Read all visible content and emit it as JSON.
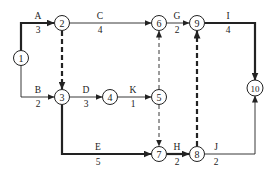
{
  "diagram": {
    "type": "activity-on-arrow network (double-code network diagram)",
    "colors": {
      "line": "#222222",
      "background": "#ffffff"
    },
    "nodes": [
      {
        "id": "1",
        "x": 21,
        "y": 58
      },
      {
        "id": "2",
        "x": 62,
        "y": 23
      },
      {
        "id": "3",
        "x": 62,
        "y": 97
      },
      {
        "id": "4",
        "x": 110,
        "y": 97
      },
      {
        "id": "5",
        "x": 159,
        "y": 97
      },
      {
        "id": "6",
        "x": 159,
        "y": 23
      },
      {
        "id": "7",
        "x": 159,
        "y": 154
      },
      {
        "id": "8",
        "x": 197,
        "y": 154
      },
      {
        "id": "9",
        "x": 197,
        "y": 23
      },
      {
        "id": "10",
        "x": 255,
        "y": 88
      }
    ],
    "activities": [
      {
        "name": "A",
        "duration": "3",
        "from": "1",
        "to": "2",
        "critical": true,
        "dummy": false
      },
      {
        "name": "B",
        "duration": "2",
        "from": "1",
        "to": "3",
        "critical": false,
        "dummy": false
      },
      {
        "name": "C",
        "duration": "4",
        "from": "2",
        "to": "6",
        "critical": false,
        "dummy": false
      },
      {
        "name": "D",
        "duration": "3",
        "from": "3",
        "to": "4",
        "critical": false,
        "dummy": false
      },
      {
        "name": "K",
        "duration": "1",
        "from": "4",
        "to": "5",
        "critical": false,
        "dummy": false
      },
      {
        "name": "E",
        "duration": "5",
        "from": "3",
        "to": "7",
        "critical": true,
        "dummy": false
      },
      {
        "name": "G",
        "duration": "2",
        "from": "6",
        "to": "9",
        "critical": false,
        "dummy": false
      },
      {
        "name": "H",
        "duration": "2",
        "from": "7",
        "to": "8",
        "critical": true,
        "dummy": false
      },
      {
        "name": "I",
        "duration": "4",
        "from": "9",
        "to": "10",
        "critical": true,
        "dummy": false
      },
      {
        "name": "J",
        "duration": "2",
        "from": "8",
        "to": "10",
        "critical": false,
        "dummy": false
      },
      {
        "name": "",
        "duration": "",
        "from": "2",
        "to": "3",
        "critical": true,
        "dummy": true
      },
      {
        "name": "",
        "duration": "",
        "from": "5",
        "to": "6",
        "critical": false,
        "dummy": true
      },
      {
        "name": "",
        "duration": "",
        "from": "5",
        "to": "7",
        "critical": false,
        "dummy": true
      },
      {
        "name": "",
        "duration": "",
        "from": "8",
        "to": "9",
        "critical": true,
        "dummy": true
      }
    ],
    "labels": {
      "n1": "1",
      "n2": "2",
      "n3": "3",
      "n4": "4",
      "n5": "5",
      "n6": "6",
      "n7": "7",
      "n8": "8",
      "n9": "9",
      "n10": "10",
      "A": "A",
      "A_d": "3",
      "B": "B",
      "B_d": "2",
      "C": "C",
      "C_d": "4",
      "D": "D",
      "D_d": "3",
      "K": "K",
      "K_d": "1",
      "E": "E",
      "E_d": "5",
      "G": "G",
      "G_d": "2",
      "H": "H",
      "H_d": "2",
      "I": "I",
      "I_d": "4",
      "J": "J",
      "J_d": "2"
    }
  }
}
